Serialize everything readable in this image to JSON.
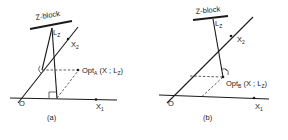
{
  "panels": [
    {
      "id": "a",
      "caption": "(a)",
      "block_label": "Z-block",
      "rod_label": "L",
      "rod_sub": "Z",
      "axis2_label": "X",
      "axis2_sub": "2",
      "axis1_label": "X",
      "axis1_sub": "1",
      "origin_label": "O",
      "point_label": "Opt",
      "point_sub": "A",
      "point_args": "(X ; L",
      "point_args_sub": "Z",
      "point_args_close": ")"
    },
    {
      "id": "b",
      "caption": "(b)",
      "block_label": "Z-block",
      "rod_label": "L",
      "rod_sub": "Z",
      "axis2_label": "X",
      "axis2_sub": "2",
      "axis1_label": "X",
      "axis1_sub": "1",
      "origin_label": "O",
      "point_label": "Opt",
      "point_sub": "B",
      "point_args": "(X ; L",
      "point_args_sub": "Z",
      "point_args_close": ")"
    }
  ]
}
